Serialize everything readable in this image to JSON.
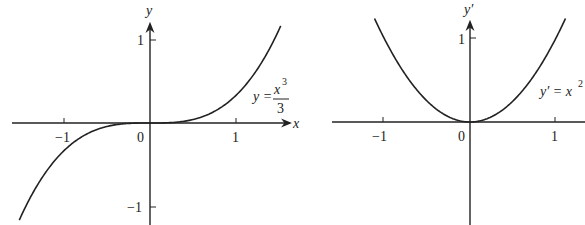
{
  "chart_data": [
    {
      "type": "line",
      "title": "",
      "xlabel": "x",
      "ylabel": "y",
      "x_ticks": [
        "-1",
        "0",
        "1"
      ],
      "y_ticks": [
        "1",
        "-1"
      ],
      "xlim": [
        -1.6,
        1.6
      ],
      "ylim": [
        -1.25,
        1.2
      ],
      "grid": false,
      "series": [
        {
          "name": "y = x^3/3",
          "function": "x^3/3",
          "x": [
            -1.5,
            -1.0,
            -0.5,
            0,
            0.5,
            1.0,
            1.5
          ],
          "values": [
            -1.125,
            -0.333,
            -0.042,
            0,
            0.042,
            0.333,
            1.125
          ]
        }
      ],
      "annotations": [
        {
          "text": "y = x³/3",
          "position": "right of curve, above x-axis"
        }
      ]
    },
    {
      "type": "line",
      "title": "",
      "xlabel": "",
      "ylabel": "y'",
      "x_ticks": [
        "-1",
        "0",
        "1"
      ],
      "y_ticks": [
        "1"
      ],
      "xlim": [
        -1.6,
        1.4
      ],
      "ylim": [
        -1.25,
        1.2
      ],
      "grid": false,
      "series": [
        {
          "name": "y' = x^2",
          "function": "x^2",
          "x": [
            -1.1,
            -1.0,
            -0.5,
            0,
            0.5,
            1.0,
            1.1
          ],
          "values": [
            1.21,
            1.0,
            0.25,
            0,
            0.25,
            1.0,
            1.21
          ]
        }
      ],
      "annotations": [
        {
          "text": "y' = x²",
          "position": "right of curve, above x-axis"
        }
      ]
    }
  ],
  "left": {
    "axis_y_label": "y",
    "axis_x_label": "x",
    "tick_x_neg1": "−1",
    "tick_x_0": "0",
    "tick_x_1": "1",
    "tick_y_1": "1",
    "tick_y_neg1": "−1",
    "eq_lhs": "y =",
    "eq_num": "x",
    "eq_exp": "3",
    "eq_den": "3"
  },
  "right": {
    "axis_y_label": "y′",
    "tick_x_neg1": "−1",
    "tick_x_0": "0",
    "tick_x_1": "1",
    "tick_y_1": "1",
    "eq_lhs": "y′ = x",
    "eq_exp": "2"
  }
}
